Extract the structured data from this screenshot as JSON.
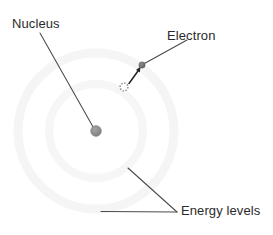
{
  "figure": {
    "kind": "atom-bohr-model-diagram",
    "background_color": "#ffffff",
    "width": 273,
    "height": 235
  },
  "labels": {
    "nucleus": "Nucleus",
    "electron": "Electron",
    "energy_levels": "Energy levels"
  },
  "colors": {
    "text": "#2b2b2b",
    "leader_line": "#4a4a4a",
    "nucleus_fill": "#8c8c8c",
    "nucleus_stroke": "#7a7a7a",
    "electron_fill": "#6f6f6f",
    "electron_ghost_stroke": "#8f8f8f",
    "arrow": "#242424",
    "ring_outer": "#ededed",
    "ring_inner": "#eaeaea"
  },
  "geometry": {
    "center": {
      "x": 96,
      "y": 131
    },
    "rings": [
      {
        "name": "inner-energy-level",
        "radius": 47,
        "stroke_width": 3
      },
      {
        "name": "outer-energy-level",
        "radius": 78,
        "stroke_width": 4
      }
    ],
    "nucleus": {
      "x": 96,
      "y": 131,
      "radius": 5.4
    },
    "electron_excited": {
      "x": 142,
      "y": 65,
      "radius": 3.2
    },
    "electron_ground_ghost": {
      "x": 124,
      "y": 87,
      "radius": 4.0
    },
    "transition_arrow": {
      "x1": 129,
      "y1": 83,
      "x2": 139.5,
      "y2": 69
    },
    "leaders": {
      "nucleus": {
        "x1": 40,
        "y1": 33,
        "x2": 94.5,
        "y2": 129.5
      },
      "electron": {
        "x1": 187,
        "y1": 40,
        "x2": 143.5,
        "y2": 64
      },
      "energy_level_upper": {
        "x1": 128,
        "y1": 168,
        "x2": 177,
        "y2": 212
      },
      "energy_level_lower": {
        "x1": 101,
        "y1": 211.5,
        "x2": 177,
        "y2": 212
      }
    }
  }
}
